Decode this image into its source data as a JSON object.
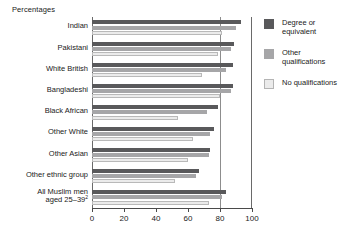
{
  "chart_data": {
    "type": "bar",
    "orientation": "horizontal",
    "title": "Percentages",
    "xlabel": "",
    "ylabel": "",
    "xlim": [
      0,
      100
    ],
    "xticks": [
      0,
      20,
      40,
      60,
      80,
      100
    ],
    "xtick_labels": [
      "0",
      "20",
      "40",
      "60",
      "80",
      "100"
    ],
    "grid": false,
    "reference_line": 80,
    "legend_position": "right",
    "categories": [
      "Indian",
      "Pakistani",
      "White British",
      "Bangladeshi",
      "Black African",
      "Other White",
      "Other Asian",
      "Other ethnic group",
      "All Muslim men aged 25–39"
    ],
    "category_footnotes": {
      "All Muslim men aged 25–39": "2"
    },
    "series": [
      {
        "name": "Degree or equivalent",
        "color": "#59595b",
        "values": [
          93,
          89,
          88,
          88,
          79,
          76,
          74,
          67,
          84
        ]
      },
      {
        "name": "Other qualifications",
        "color": "#a6a6a8",
        "values": [
          90,
          87,
          84,
          87,
          72,
          74,
          73,
          65,
          81
        ]
      },
      {
        "name": "No qualifications",
        "color": "#ebebeb",
        "values": [
          81,
          79,
          69,
          80,
          54,
          63,
          60,
          52,
          73
        ]
      }
    ]
  },
  "legend": {
    "items": [
      {
        "label": "Degree or\nequivalent"
      },
      {
        "label": "Other\nqualifications"
      },
      {
        "label": "No qualifications"
      }
    ]
  }
}
